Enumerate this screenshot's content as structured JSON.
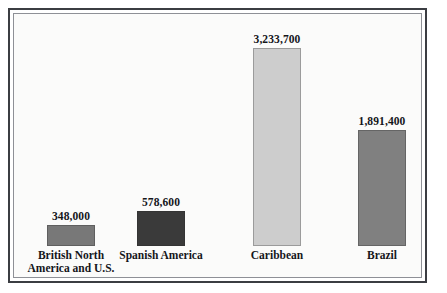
{
  "chart_data": {
    "type": "bar",
    "title": "",
    "subtitle": "",
    "xlabel": "",
    "ylabel": "",
    "grid": false,
    "legend": "none",
    "axis_visible": false,
    "value_labels_shown": true,
    "ylim": [
      0,
      3233700
    ],
    "categories": [
      "British North America and U.S.",
      "Spanish America",
      "Caribbean",
      "Brazil"
    ],
    "values": [
      348000,
      578600,
      3233700,
      1891400
    ],
    "value_labels": [
      "348,000",
      "578,600",
      "3,233,700",
      "1,891,400"
    ],
    "bars": [
      {
        "category": "British North America and U.S.",
        "label_line1": "British North",
        "label_line2": "America and U.S.",
        "value": 348000,
        "value_label": "348,000",
        "color": "#787878"
      },
      {
        "category": "Spanish America",
        "label_line1": "Spanish America",
        "label_line2": "",
        "value": 578600,
        "value_label": "578,600",
        "color": "#3a3a3a"
      },
      {
        "category": "Caribbean",
        "label_line1": "Caribbean",
        "label_line2": "",
        "value": 3233700,
        "value_label": "3,233,700",
        "color": "#cdcdcd"
      },
      {
        "category": "Brazil",
        "label_line1": "Brazil",
        "label_line2": "",
        "value": 1891400,
        "value_label": "1,891,400",
        "color": "#808080"
      }
    ]
  },
  "figure": {
    "background_color": "#fbfbfa",
    "frame_color": "#3b3d42",
    "inner_rule_color": "#8e9096"
  }
}
